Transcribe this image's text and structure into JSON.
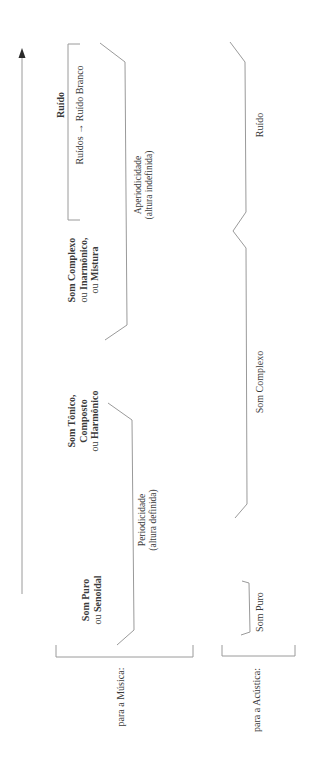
{
  "colors": {
    "line": "#9a9a9a",
    "text": "#3a3a3a",
    "bold_text": "#2a2a2a",
    "background": "#ffffff"
  },
  "axis": {
    "direction_icon": "arrow-up-icon"
  },
  "categories": {
    "musica_label": "para a Música:",
    "acustica_label": "para a Acústica:"
  },
  "musica": {
    "ruido": {
      "title": "Ruído",
      "subtitle": "Ruídos → Ruído Branco"
    },
    "som_complexo": {
      "line1_bold": "Som Complexo",
      "line2_prefix": "ou ",
      "line2_bold": "Inarmônico,",
      "line3_prefix": "ou ",
      "line3_bold": "Mistura"
    },
    "som_tonico": {
      "line1_bold": "Som Tônico,",
      "line2_bold": "Composto",
      "line3_prefix": "ou ",
      "line3_bold": "Harmônico"
    },
    "som_puro": {
      "line1_bold": "Som Puro",
      "line2_prefix": "ou ",
      "line2_bold": "Senoidal"
    }
  },
  "propriedades": {
    "aperiodicidade": {
      "line1": "Aperiodicidade",
      "line2": "(altura indefinida)"
    },
    "periodicidade": {
      "line1": "Periodicidade",
      "line2": "(altura definida)"
    }
  },
  "acustica": {
    "ruido": "Ruído",
    "som_complexo": "Som Complexo",
    "som_puro": "Som Puro"
  }
}
